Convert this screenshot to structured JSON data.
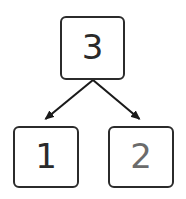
{
  "diagram": {
    "background_color": "#ffffff",
    "width": 186,
    "height": 199,
    "node_border_color": "#2b2b2b",
    "node_fill_color": "#ffffff",
    "edge_color": "#1a1a1a",
    "nodes": [
      {
        "id": "root",
        "label": "3",
        "role": "root",
        "text_color": "#2a2a2a",
        "x": 60,
        "y": 16,
        "width": 65,
        "height": 64
      },
      {
        "id": "left",
        "label": "1",
        "role": "left-child",
        "text_color": "#2a2a2a",
        "x": 13,
        "y": 126,
        "width": 66,
        "height": 62
      },
      {
        "id": "right",
        "label": "2",
        "role": "right-child",
        "text_color": "#6b6b6b",
        "x": 108,
        "y": 126,
        "width": 66,
        "height": 62
      }
    ],
    "edges": [
      {
        "id": "root-to-left",
        "from": "root",
        "to": "left",
        "arrowhead": "filled-triangle",
        "start_x": 93,
        "start_y": 80,
        "end_x": 42,
        "end_y": 123
      },
      {
        "id": "root-to-right",
        "from": "root",
        "to": "right",
        "arrowhead": "filled-triangle",
        "start_x": 93,
        "start_y": 80,
        "end_x": 143,
        "end_y": 123
      }
    ]
  }
}
